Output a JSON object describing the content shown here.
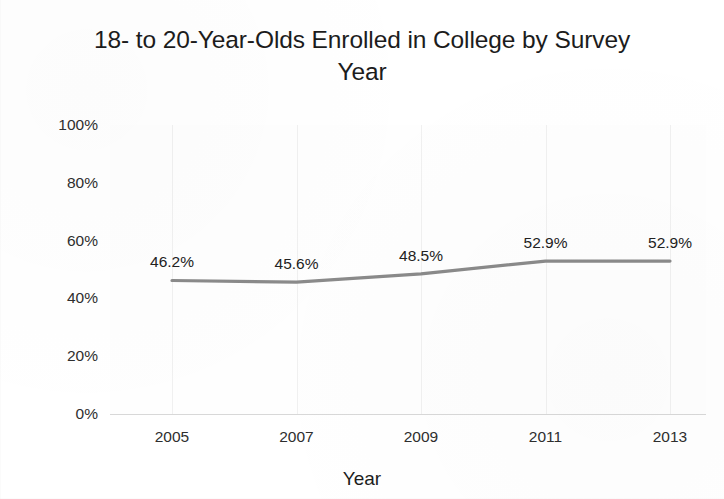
{
  "chart_data": {
    "type": "line",
    "title": "18- to 20-Year-Olds Enrolled in College by Survey Year",
    "title_line1": "18- to 20-Year-Olds Enrolled in College by Survey",
    "title_line2": "Year",
    "xlabel": "Year",
    "ylabel": "",
    "categories": [
      "2005",
      "2007",
      "2009",
      "2011",
      "2013"
    ],
    "values": [
      46.2,
      45.6,
      48.5,
      52.9,
      52.9
    ],
    "data_labels": [
      "46.2%",
      "45.6%",
      "48.5%",
      "52.9%",
      "52.9%"
    ],
    "ylim": [
      0,
      100
    ],
    "yticks": [
      100,
      80,
      60,
      40,
      20,
      0
    ],
    "ytick_labels": [
      "100%",
      "80%",
      "60%",
      "40%",
      "20%",
      "0%"
    ],
    "grid": "vertical-only",
    "legend": "none",
    "series_color": "#8a8a8a",
    "text_color": "#1c1c1c",
    "gridline_color": "#f0f0f0",
    "axis_color": "#d8d8d8",
    "background_color": "#ffffff"
  }
}
